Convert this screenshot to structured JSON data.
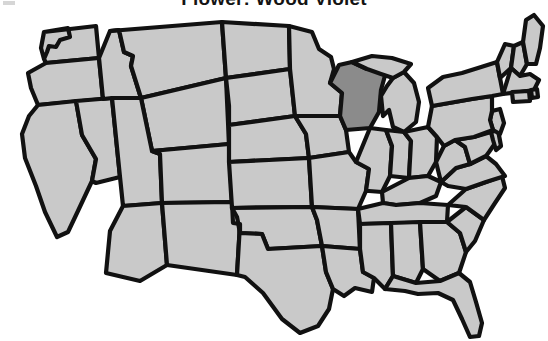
{
  "page": {
    "background_color": "#ffffff",
    "width": 548,
    "height": 341
  },
  "title": {
    "text": "Flower: Wood Violet",
    "clipped_at_top": true,
    "color": "#141414"
  },
  "corner_mark": {
    "name": "scan-artifact",
    "color": "#cfcfcf"
  },
  "map": {
    "name": "united-states-map",
    "region": "Contiguous United States",
    "projection_note": "stylized outline map, 48 states",
    "colors": {
      "state_fill": "#c9c9c9",
      "highlight_fill": "#8b8b8b",
      "border": "#111111",
      "background": "#ffffff"
    },
    "highlighted_states": [
      "Wisconsin"
    ],
    "states": [
      {
        "code": "WA",
        "name": "Washington",
        "highlighted": false
      },
      {
        "code": "OR",
        "name": "Oregon",
        "highlighted": false
      },
      {
        "code": "CA",
        "name": "California",
        "highlighted": false
      },
      {
        "code": "NV",
        "name": "Nevada",
        "highlighted": false
      },
      {
        "code": "ID",
        "name": "Idaho",
        "highlighted": false
      },
      {
        "code": "MT",
        "name": "Montana",
        "highlighted": false
      },
      {
        "code": "WY",
        "name": "Wyoming",
        "highlighted": false
      },
      {
        "code": "UT",
        "name": "Utah",
        "highlighted": false
      },
      {
        "code": "AZ",
        "name": "Arizona",
        "highlighted": false
      },
      {
        "code": "NM",
        "name": "New Mexico",
        "highlighted": false
      },
      {
        "code": "CO",
        "name": "Colorado",
        "highlighted": false
      },
      {
        "code": "ND",
        "name": "North Dakota",
        "highlighted": false
      },
      {
        "code": "SD",
        "name": "South Dakota",
        "highlighted": false
      },
      {
        "code": "NE",
        "name": "Nebraska",
        "highlighted": false
      },
      {
        "code": "KS",
        "name": "Kansas",
        "highlighted": false
      },
      {
        "code": "OK",
        "name": "Oklahoma",
        "highlighted": false
      },
      {
        "code": "TX",
        "name": "Texas",
        "highlighted": false
      },
      {
        "code": "MN",
        "name": "Minnesota",
        "highlighted": false
      },
      {
        "code": "IA",
        "name": "Iowa",
        "highlighted": false
      },
      {
        "code": "MO",
        "name": "Missouri",
        "highlighted": false
      },
      {
        "code": "AR",
        "name": "Arkansas",
        "highlighted": false
      },
      {
        "code": "LA",
        "name": "Louisiana",
        "highlighted": false
      },
      {
        "code": "WI",
        "name": "Wisconsin",
        "highlighted": true
      },
      {
        "code": "IL",
        "name": "Illinois",
        "highlighted": false
      },
      {
        "code": "MI",
        "name": "Michigan",
        "highlighted": false
      },
      {
        "code": "IN",
        "name": "Indiana",
        "highlighted": false
      },
      {
        "code": "OH",
        "name": "Ohio",
        "highlighted": false
      },
      {
        "code": "KY",
        "name": "Kentucky",
        "highlighted": false
      },
      {
        "code": "TN",
        "name": "Tennessee",
        "highlighted": false
      },
      {
        "code": "MS",
        "name": "Mississippi",
        "highlighted": false
      },
      {
        "code": "AL",
        "name": "Alabama",
        "highlighted": false
      },
      {
        "code": "GA",
        "name": "Georgia",
        "highlighted": false
      },
      {
        "code": "FL",
        "name": "Florida",
        "highlighted": false
      },
      {
        "code": "SC",
        "name": "South Carolina",
        "highlighted": false
      },
      {
        "code": "NC",
        "name": "North Carolina",
        "highlighted": false
      },
      {
        "code": "VA",
        "name": "Virginia",
        "highlighted": false
      },
      {
        "code": "WV",
        "name": "West Virginia",
        "highlighted": false
      },
      {
        "code": "MD",
        "name": "Maryland",
        "highlighted": false
      },
      {
        "code": "DE",
        "name": "Delaware",
        "highlighted": false
      },
      {
        "code": "NJ",
        "name": "New Jersey",
        "highlighted": false
      },
      {
        "code": "PA",
        "name": "Pennsylvania",
        "highlighted": false
      },
      {
        "code": "NY",
        "name": "New York",
        "highlighted": false
      },
      {
        "code": "CT",
        "name": "Connecticut",
        "highlighted": false
      },
      {
        "code": "RI",
        "name": "Rhode Island",
        "highlighted": false
      },
      {
        "code": "MA",
        "name": "Massachusetts",
        "highlighted": false
      },
      {
        "code": "VT",
        "name": "Vermont",
        "highlighted": false
      },
      {
        "code": "NH",
        "name": "New Hampshire",
        "highlighted": false
      },
      {
        "code": "ME",
        "name": "Maine",
        "highlighted": false
      }
    ]
  }
}
